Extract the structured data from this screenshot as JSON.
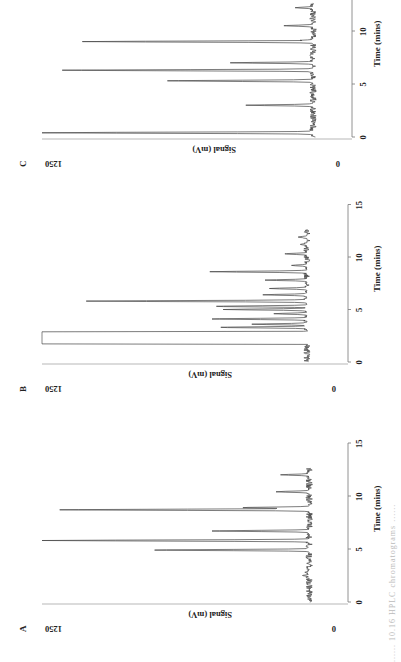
{
  "figure": {
    "caption_fragment": "...... 10.16   HPLC chromatograms ......"
  },
  "chart_data": [
    {
      "type": "line",
      "panel": "A",
      "title": "A",
      "xlabel": "Time (mins)",
      "ylabel": "Signal (mV)",
      "xlim": [
        0,
        15
      ],
      "ylim": [
        0,
        1250
      ],
      "xticks": [
        0,
        5,
        10,
        15
      ],
      "yticks": [
        0,
        1250
      ],
      "grid": false,
      "baseline_mV": 40,
      "peaks": [
        {
          "t": 2.5,
          "signal": 70
        },
        {
          "t": 2.8,
          "signal": 60
        },
        {
          "t": 4.9,
          "signal": 740
        },
        {
          "t": 5.8,
          "signal": 1250
        },
        {
          "t": 6.7,
          "signal": 480
        },
        {
          "t": 8.7,
          "signal": 1170
        },
        {
          "t": 8.9,
          "signal": 340
        },
        {
          "t": 10.4,
          "signal": 190
        },
        {
          "t": 12.0,
          "signal": 170
        }
      ]
    },
    {
      "type": "line",
      "panel": "B",
      "title": "B",
      "xlabel": "Time (mins)",
      "ylabel": "Signal (mV)",
      "xlim": [
        0,
        15
      ],
      "ylim": [
        0,
        1250
      ],
      "xticks": [
        0,
        5,
        10,
        15
      ],
      "yticks": [
        0,
        1250
      ],
      "grid": false,
      "baseline_mV": 50,
      "saturated_region": {
        "t_start": 1.7,
        "t_end": 2.9,
        "signal": 1250
      },
      "peaks": [
        {
          "t": 3.3,
          "signal": 440
        },
        {
          "t": 3.6,
          "signal": 300
        },
        {
          "t": 4.1,
          "signal": 480
        },
        {
          "t": 4.6,
          "signal": 200
        },
        {
          "t": 5.0,
          "signal": 430
        },
        {
          "t": 5.3,
          "signal": 460
        },
        {
          "t": 5.8,
          "signal": 1050
        },
        {
          "t": 6.4,
          "signal": 250
        },
        {
          "t": 7.0,
          "signal": 220
        },
        {
          "t": 7.8,
          "signal": 240
        },
        {
          "t": 8.6,
          "signal": 490
        },
        {
          "t": 9.2,
          "signal": 120
        },
        {
          "t": 10.3,
          "signal": 150
        },
        {
          "t": 11.2,
          "signal": 80
        },
        {
          "t": 11.9,
          "signal": 90
        }
      ]
    },
    {
      "type": "line",
      "panel": "C",
      "title": "C",
      "xlabel": "Time (mins)",
      "ylabel": "Signal (mV)",
      "xlim": [
        0,
        15
      ],
      "ylim": [
        0,
        1250
      ],
      "xticks": [
        0,
        5,
        10,
        15
      ],
      "yticks": [
        0,
        1250
      ],
      "grid": false,
      "baseline_mV": 40,
      "peaks": [
        {
          "t": 0.4,
          "signal": 1250
        },
        {
          "t": 3.0,
          "signal": 340
        },
        {
          "t": 5.3,
          "signal": 690
        },
        {
          "t": 6.3,
          "signal": 1160
        },
        {
          "t": 7.0,
          "signal": 410
        },
        {
          "t": 9.0,
          "signal": 1070
        },
        {
          "t": 9.1,
          "signal": 90
        },
        {
          "t": 10.5,
          "signal": 170
        },
        {
          "t": 12.2,
          "signal": 120
        }
      ]
    }
  ],
  "panels": [
    {
      "letter": "A",
      "ylabel": "Signal (mV)",
      "xlabel": "Time (mins)",
      "ytick_top": "1250",
      "ytick_bottom": "0",
      "xticks": [
        "0",
        "5",
        "10",
        "15"
      ]
    },
    {
      "letter": "B",
      "ylabel": "Signal (mV)",
      "xlabel": "Time (mins)",
      "ytick_top": "1250",
      "ytick_bottom": "0",
      "xticks": [
        "0",
        "5",
        "10",
        "15"
      ]
    },
    {
      "letter": "C",
      "ylabel": "Signal (mV)",
      "xlabel": "Time (mins)",
      "ytick_top": "1250",
      "ytick_bottom": "0",
      "xticks": [
        "0",
        "5",
        "10",
        "15"
      ]
    }
  ]
}
